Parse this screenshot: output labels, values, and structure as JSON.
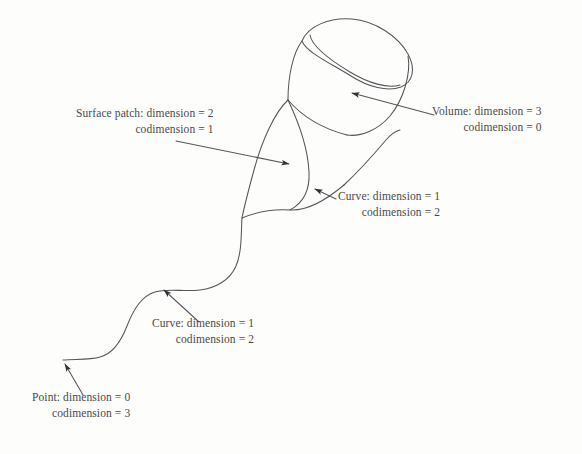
{
  "figure": {
    "background_color": "#fdfdfc",
    "ink_color": "#55565a",
    "text_color": "#4a4a4a"
  },
  "labels": {
    "surface_patch": {
      "line1": "Surface patch: dimension = 2",
      "line2": "codimension = 1",
      "entity": "surface-patch",
      "dimension": 2,
      "codimension": 1
    },
    "volume": {
      "line1": "Volume: dimension = 3",
      "line2": "codimension = 0",
      "entity": "volume",
      "dimension": 3,
      "codimension": 0
    },
    "curve_upper": {
      "line1": "Curve: dimension = 1",
      "line2": "codimension = 2",
      "entity": "curve",
      "dimension": 1,
      "codimension": 2
    },
    "curve_lower": {
      "line1": "Curve: dimension = 1",
      "line2": "codimension = 2",
      "entity": "curve",
      "dimension": 1,
      "codimension": 2
    },
    "point": {
      "line1": "Point: dimension = 0",
      "line2": "codimension = 3",
      "entity": "point",
      "dimension": 0,
      "codimension": 3
    }
  },
  "geometry": {
    "volume_shape": "open-cylinder",
    "surface_shape": "tapered-cone-patch",
    "curve_shape": "s-curve-tail",
    "point_shape": "curve-endpoint"
  }
}
